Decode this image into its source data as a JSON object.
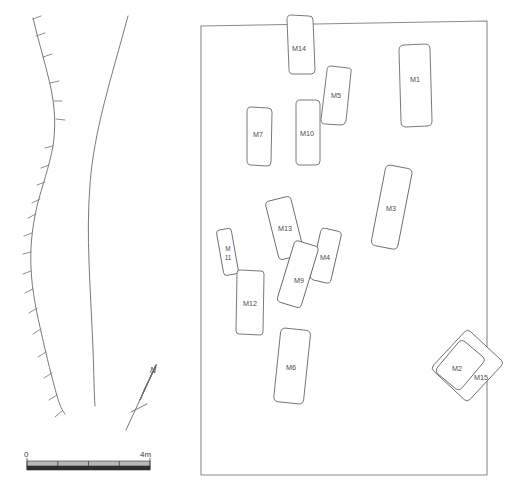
{
  "figure": {
    "kind": "archaeological-site-plan",
    "background_color": "#ffffff",
    "line_color": "#6b6b6b",
    "label_color": "#4a4a4a",
    "width": 510,
    "height": 489
  },
  "left_panel": {
    "name": "terrain-contour-panel",
    "features": [
      {
        "name": "hachured-slope-line",
        "description": "left curving line with tick hachures"
      },
      {
        "name": "plain-contour-line",
        "description": "right curving line"
      }
    ]
  },
  "north_arrow": {
    "label": "N"
  },
  "scale_bar": {
    "start_label": "0",
    "end_label": "4m",
    "divisions": 4,
    "unit": "m",
    "length_meters": 4
  },
  "site_box": {
    "name": "excavation-area-boundary"
  },
  "tombs": [
    {
      "id": "M14",
      "label": "M14",
      "cx": 299,
      "cy": 48,
      "w": 26,
      "h": 62,
      "rot": 4,
      "label_dx": 0,
      "label_dy": 0
    },
    {
      "id": "M1",
      "label": "M1",
      "cx": 414,
      "cy": 85,
      "w": 32,
      "h": 78,
      "rot": 3,
      "label_dx": 0,
      "label_dy": -5
    },
    {
      "id": "M5",
      "label": "M5",
      "cx": 337,
      "cy": 96,
      "w": 24,
      "h": 56,
      "rot": 8,
      "label_dx": 0,
      "label_dy": 0
    },
    {
      "id": "M7",
      "label": "M7",
      "cx": 258,
      "cy": 136,
      "w": 24,
      "h": 56,
      "rot": 3,
      "label_dx": 0,
      "label_dy": -1
    },
    {
      "id": "M10",
      "label": "M10",
      "cx": 306,
      "cy": 134,
      "w": 23,
      "h": 62,
      "rot": 2,
      "label_dx": 0,
      "label_dy": 0
    },
    {
      "id": "M3",
      "label": "M3",
      "cx": 391,
      "cy": 208,
      "w": 27,
      "h": 78,
      "rot": 11,
      "label_dx": 0,
      "label_dy": 0
    },
    {
      "id": "M13",
      "label": "M13",
      "cx": 285,
      "cy": 229,
      "w": 26,
      "h": 58,
      "rot": -14,
      "label_dx": 0,
      "label_dy": 0
    },
    {
      "id": "M11",
      "label": "M\n11",
      "cx": 227,
      "cy": 252,
      "w": 16,
      "h": 44,
      "rot": -10,
      "label_dx": 0,
      "label_dy": 0
    },
    {
      "id": "M4",
      "label": "M4",
      "cx": 325,
      "cy": 257,
      "w": 22,
      "h": 50,
      "rot": 13,
      "label_dx": 0,
      "label_dy": 0
    },
    {
      "id": "M9",
      "label": "M9",
      "cx": 297,
      "cy": 275,
      "w": 25,
      "h": 62,
      "rot": 17,
      "label_dx": 0,
      "label_dy": 4
    },
    {
      "id": "M12",
      "label": "M12",
      "cx": 250,
      "cy": 303,
      "w": 27,
      "h": 62,
      "rot": -1,
      "label_dx": 0,
      "label_dy": 0
    },
    {
      "id": "M6",
      "label": "M6",
      "cx": 292,
      "cy": 367,
      "w": 30,
      "h": 68,
      "rot": 6,
      "label_dx": 0,
      "label_dy": 0
    },
    {
      "id": "M15",
      "label": "M15",
      "cx": 466,
      "cy": 367,
      "w": 52,
      "h": 56,
      "rot": 42,
      "label_dx": 14,
      "label_dy": 11
    },
    {
      "id": "M2",
      "label": "M2",
      "cx": 457,
      "cy": 369,
      "w": 34,
      "h": 44,
      "rot": 40,
      "label_dx": 0,
      "label_dy": 0
    }
  ]
}
